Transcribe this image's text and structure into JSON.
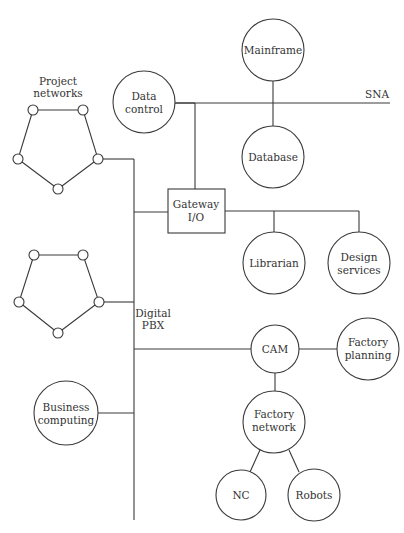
{
  "diagram": {
    "bus_label_line1": "Digital",
    "bus_label_line2": "PBX",
    "sna_label": "SNA",
    "project_networks_line1": "Project",
    "project_networks_line2": "networks",
    "nodes": {
      "mainframe": "Mainframe",
      "data_control_1": "Data",
      "data_control_2": "control",
      "database": "Database",
      "gateway_1": "Gateway",
      "gateway_2": "I/O",
      "librarian": "Librarian",
      "design_services_1": "Design",
      "design_services_2": "services",
      "cam": "CAM",
      "factory_planning_1": "Factory",
      "factory_planning_2": "planning",
      "factory_network_1": "Factory",
      "factory_network_2": "network",
      "nc": "NC",
      "robots": "Robots",
      "business_computing_1": "Business",
      "business_computing_2": "computing"
    }
  }
}
